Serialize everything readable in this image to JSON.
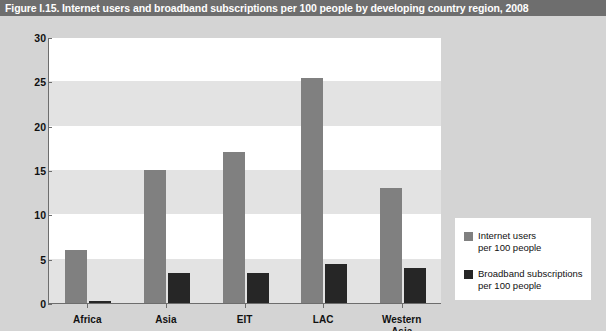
{
  "figure": {
    "title": "Figure I.15. Internet users and broadband subscriptions per 100 people by developing country region, 2008"
  },
  "colors": {
    "title_bar": "#6e6e6e",
    "background": "#d4d4d4",
    "plot_background": "#ffffff",
    "band": "#e3e3e3",
    "series_internet_users": "#808080",
    "series_broadband": "#262626",
    "axis": "#6d6d6d"
  },
  "chart_data": {
    "type": "bar",
    "title": "Figure I.15. Internet users and broadband subscriptions per 100 people by developing country region, 2008",
    "categories": [
      "Africa",
      "Asia",
      "EIT",
      "LAC",
      "Western\nAsia"
    ],
    "series": [
      {
        "name": "Internet users\nper 100 people",
        "values": [
          6.0,
          15.0,
          17.0,
          25.4,
          13.0
        ]
      },
      {
        "name": "Broadband subscriptions\nper 100 people",
        "values": [
          0.2,
          3.4,
          3.4,
          4.4,
          4.0
        ]
      }
    ],
    "xlabel": "",
    "ylabel": "",
    "ylim": [
      0,
      30
    ],
    "yticks": [
      0,
      5,
      10,
      15,
      20,
      25,
      30
    ],
    "ytick_labels": [
      "0",
      "5",
      "10",
      "15",
      "20",
      "25",
      "30"
    ],
    "grid": false,
    "banded_background": true,
    "legend_position": "bottom-right"
  },
  "legend": {
    "items": [
      {
        "label": "Internet users\nper 100 people",
        "color": "#808080"
      },
      {
        "label": "Broadband subscriptions\nper 100 people",
        "color": "#262626"
      }
    ]
  }
}
